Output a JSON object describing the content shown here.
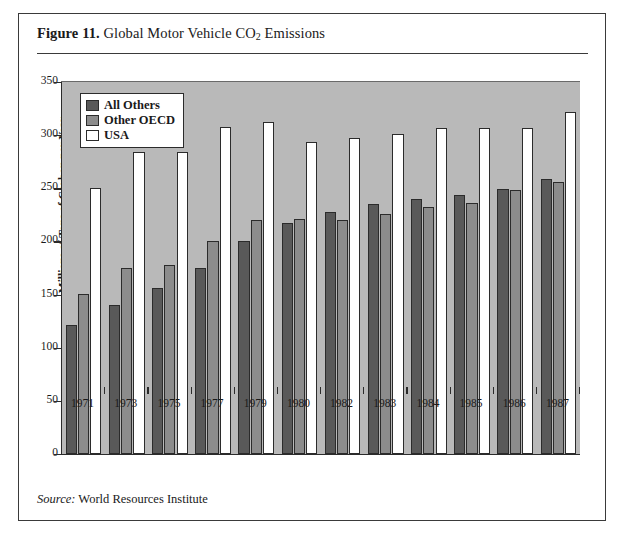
{
  "figure": {
    "number_label": "Figure 11.",
    "title": "Global Motor Vehicle CO2 Emissions",
    "title_main": "Global Motor Vehicle CO",
    "title_sub": "2",
    "title_tail": " Emissions",
    "source_label": "Source:",
    "source_text": "World Resources Institute"
  },
  "colors": {
    "plot_background": "#b9b9b9",
    "series_all_others": "#595959",
    "series_other_oecd": "#8c8c8c",
    "series_usa": "#ffffff",
    "axis": "#2b2b2b",
    "frame": "#3a3a3a"
  },
  "legend": {
    "position": "top-left-inside-plot",
    "entries": [
      {
        "label": "All Others",
        "color": "#595959"
      },
      {
        "label": "Other OECD",
        "color": "#8c8c8c"
      },
      {
        "label": "USA",
        "color": "#ffffff"
      }
    ]
  },
  "chart_data": {
    "type": "bar",
    "title": "Global Motor Vehicle CO2 Emissions",
    "xlabel": "",
    "ylabel": "Millions of Tons of Carbon per Year",
    "ylim": [
      0,
      350
    ],
    "yticks": [
      0,
      50,
      100,
      150,
      200,
      250,
      300,
      350
    ],
    "ytick_labels": [
      "0",
      "50",
      "100",
      "150",
      "200",
      "250",
      "300",
      "350"
    ],
    "grid": false,
    "legend_position": "upper left",
    "categories": [
      "1971",
      "1973",
      "1975",
      "1977",
      "1979",
      "1980",
      "1982",
      "1983",
      "1984",
      "1985",
      "1986",
      "1987"
    ],
    "series": [
      {
        "name": "All Others",
        "color": "#595959",
        "values": [
          121,
          140,
          156,
          175,
          200,
          217,
          228,
          235,
          240,
          244,
          249,
          259
        ]
      },
      {
        "name": "Other OECD",
        "color": "#8c8c8c",
        "values": [
          151,
          175,
          178,
          200,
          220,
          221,
          220,
          226,
          232,
          236,
          248,
          256
        ]
      },
      {
        "name": "USA",
        "color": "#ffffff",
        "values": [
          250,
          284,
          284,
          308,
          312,
          294,
          297,
          301,
          307,
          307,
          307,
          322
        ]
      }
    ]
  }
}
